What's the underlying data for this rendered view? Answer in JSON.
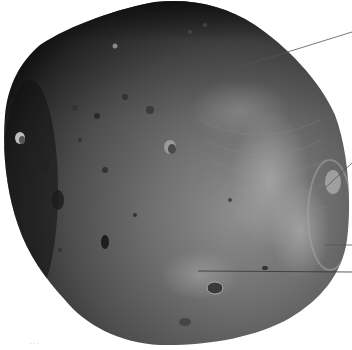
{
  "image": {
    "subject": "Phobos (moon of Mars), grayscale spacecraft photo",
    "background_color": "#ffffff",
    "body_colors": {
      "dark_limb": "#1a1a1a",
      "mid_surface": "#5a5a5a",
      "bright_region": "#9a9a9a"
    }
  },
  "annotations": {
    "line_color": "#555555",
    "leaders": [
      {
        "name": "leader-line-top",
        "x1": 236,
        "y1": 68,
        "x2": 352,
        "y2": 32
      },
      {
        "name": "leader-line-right-upper",
        "x1": 325,
        "y1": 188,
        "x2": 352,
        "y2": 163
      },
      {
        "name": "leader-line-right-middle",
        "x1": 325,
        "y1": 245,
        "x2": 352,
        "y2": 245
      },
      {
        "name": "leader-line-bottom",
        "x1": 198,
        "y1": 271,
        "x2": 352,
        "y2": 272
      }
    ]
  },
  "caption": {
    "text": "· · ·"
  }
}
